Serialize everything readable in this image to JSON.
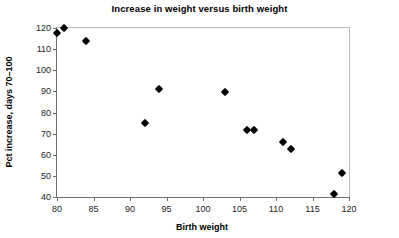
{
  "chart_data": {
    "type": "scatter",
    "title": "Increase in weight versus birth weight",
    "xlabel": "Birth weight",
    "ylabel": "Pct increase, days 70–100",
    "xlim": [
      80,
      120
    ],
    "ylim": [
      40,
      120
    ],
    "xticks": [
      80,
      85,
      90,
      95,
      100,
      105,
      110,
      115,
      120
    ],
    "yticks": [
      40,
      50,
      60,
      70,
      80,
      90,
      100,
      110,
      120
    ],
    "grid": false,
    "legend": null,
    "marker": "diamond",
    "marker_color": "#000000",
    "series": [
      {
        "name": "observations",
        "x": [
          80,
          81,
          84,
          92,
          94,
          103,
          106,
          107,
          111,
          112,
          118,
          119
        ],
        "y": [
          117.8,
          119.8,
          113.8,
          74.8,
          91.0,
          89.8,
          71.8,
          71.8,
          65.8,
          62.6,
          41.2,
          51.5
        ],
        "points": [
          {
            "x": 80,
            "y": 117.8
          },
          {
            "x": 81,
            "y": 119.8
          },
          {
            "x": 84,
            "y": 113.8
          },
          {
            "x": 92,
            "y": 74.8
          },
          {
            "x": 94,
            "y": 91.0
          },
          {
            "x": 103,
            "y": 89.8
          },
          {
            "x": 106,
            "y": 71.8
          },
          {
            "x": 107,
            "y": 71.8
          },
          {
            "x": 111,
            "y": 65.8
          },
          {
            "x": 112,
            "y": 62.6
          },
          {
            "x": 118,
            "y": 41.2
          },
          {
            "x": 119,
            "y": 51.5
          }
        ]
      }
    ]
  },
  "colors": {
    "plot_border_light": "#b9b9b9",
    "axis_line": "#6f6f6f",
    "marker": "#000000",
    "text": "#000000",
    "background": "#ffffff"
  }
}
